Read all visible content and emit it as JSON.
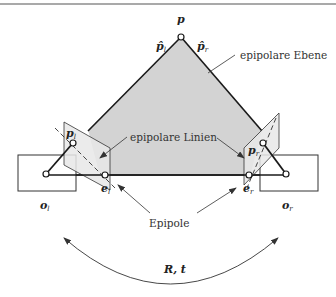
{
  "diagram": {
    "colors": {
      "plane_fill": "#d3d3d3",
      "image_plane_fill": "#e6e6e6",
      "line": "#1a1a1a",
      "text": "#333333"
    },
    "points": {
      "p": "p",
      "p_hat_l": "p̂",
      "p_hat_l_sub": "l",
      "p_hat_r": "p̂",
      "p_hat_r_sub": "r",
      "p_l": "p",
      "p_l_sub": "l",
      "p_r": "p",
      "p_r_sub": "r",
      "e_l": "e",
      "e_l_sub": "l",
      "e_r": "e",
      "e_r_sub": "r",
      "o_l": "o",
      "o_l_sub": "l",
      "o_r": "o",
      "o_r_sub": "r"
    },
    "labels": {
      "epipolar_plane": "epipolare Ebene",
      "epipolar_lines": "epipolare Linien",
      "epipoles": "Epipole",
      "transform": "R, t"
    }
  }
}
